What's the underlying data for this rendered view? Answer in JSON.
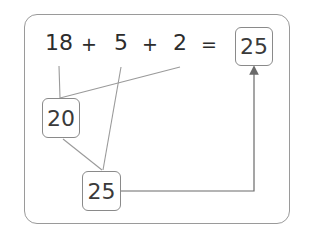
{
  "equation": {
    "terms": [
      "18",
      "5",
      "2"
    ],
    "operators": [
      "+",
      "+",
      "="
    ],
    "result": "25"
  },
  "steps": {
    "first_sum": "20",
    "second_sum": "25"
  },
  "colors": {
    "text": "#2c2c2c",
    "line": "#8a8a8a",
    "frame": "#9a9a9a"
  }
}
